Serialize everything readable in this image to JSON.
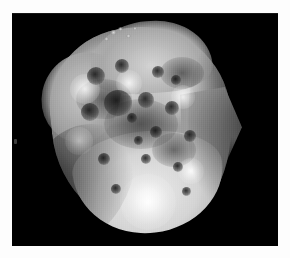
{
  "page": {
    "kind": "grayscale-spacecraft-image",
    "width_px": 290,
    "height_px": 258,
    "background_color": "#fdfdfd",
    "caption": ""
  },
  "image_frame": {
    "name": "image-frame",
    "left_px": 12,
    "top_px": 13,
    "width_px": 266,
    "height_px": 233,
    "background_color": "#000000",
    "border_color": "#000000"
  },
  "subject": {
    "name": "irregular-small-body",
    "description": "Heavily cratered irregular body filling most of the frame, brightly lit from the lower left with a rounded bright southern limb and a dark mottled cratered midsection.",
    "silhouette": {
      "left_px": 58,
      "top_px": 28,
      "right_px": 228,
      "bottom_px": 231,
      "orientation_deg": -6,
      "shape": "rounded-triangular-lump"
    },
    "surface_tone": {
      "highlight": "#ececec",
      "midtone": "#a8a8a8",
      "shadow": "#3c3c3c",
      "space_background": "#000000"
    }
  },
  "features": {
    "craters": [
      {
        "name": "crater-nw-rim",
        "cx": 96,
        "cy": 76,
        "r": 9,
        "tone": "dark"
      },
      {
        "name": "crater-n-central",
        "cx": 122,
        "cy": 66,
        "r": 7,
        "tone": "dark"
      },
      {
        "name": "crater-ne-pair-a",
        "cx": 158,
        "cy": 72,
        "r": 6,
        "tone": "dark"
      },
      {
        "name": "crater-ne-pair-b",
        "cx": 176,
        "cy": 80,
        "r": 5,
        "tone": "dark"
      },
      {
        "name": "crater-central-big",
        "cx": 118,
        "cy": 104,
        "r": 14,
        "tone": "dark"
      },
      {
        "name": "crater-central-e",
        "cx": 146,
        "cy": 100,
        "r": 8,
        "tone": "dark"
      },
      {
        "name": "crater-mid-e",
        "cx": 172,
        "cy": 108,
        "r": 7,
        "tone": "dark"
      },
      {
        "name": "crater-mid-w",
        "cx": 90,
        "cy": 112,
        "r": 9,
        "tone": "dark"
      },
      {
        "name": "crater-small-c1",
        "cx": 132,
        "cy": 118,
        "r": 5,
        "tone": "dark"
      },
      {
        "name": "crater-small-c2",
        "cx": 156,
        "cy": 132,
        "r": 6,
        "tone": "dark"
      },
      {
        "name": "crater-small-c3",
        "cx": 138,
        "cy": 140,
        "r": 4,
        "tone": "dark"
      },
      {
        "name": "crater-se-rim",
        "cx": 190,
        "cy": 136,
        "r": 6,
        "tone": "dark"
      },
      {
        "name": "crater-s-central",
        "cx": 146,
        "cy": 158,
        "r": 5,
        "tone": "dark"
      },
      {
        "name": "crater-s-east",
        "cx": 178,
        "cy": 166,
        "r": 5,
        "tone": "dark"
      },
      {
        "name": "crater-s-west",
        "cx": 104,
        "cy": 158,
        "r": 6,
        "tone": "dark"
      },
      {
        "name": "crater-sw-low",
        "cx": 116,
        "cy": 188,
        "r": 5,
        "tone": "dark"
      },
      {
        "name": "crater-se-low",
        "cx": 186,
        "cy": 190,
        "r": 4,
        "tone": "dark"
      }
    ],
    "bright_patches": [
      {
        "name": "highlight-nw-shoulder",
        "cx": 84,
        "cy": 88,
        "r": 14
      },
      {
        "name": "highlight-n-ridge",
        "cx": 128,
        "cy": 82,
        "r": 12
      },
      {
        "name": "highlight-ne-limb",
        "cx": 182,
        "cy": 96,
        "r": 11
      },
      {
        "name": "highlight-w-flank",
        "cx": 78,
        "cy": 140,
        "r": 13
      },
      {
        "name": "highlight-s-cap",
        "cx": 146,
        "cy": 200,
        "r": 26
      },
      {
        "name": "highlight-se-flank",
        "cx": 190,
        "cy": 170,
        "r": 12
      }
    ],
    "dark_patches": [
      {
        "name": "albedo-dark-nw",
        "cx": 104,
        "cy": 92,
        "rx": 26,
        "ry": 18
      },
      {
        "name": "albedo-dark-center",
        "cx": 140,
        "cy": 116,
        "rx": 34,
        "ry": 22
      },
      {
        "name": "albedo-dark-ne",
        "cx": 184,
        "cy": 70,
        "rx": 20,
        "ry": 14
      },
      {
        "name": "albedo-dark-se",
        "cx": 176,
        "cy": 148,
        "rx": 20,
        "ry": 15
      }
    ],
    "detached_specks": [
      {
        "name": "speck-a",
        "cx": 113,
        "cy": 33,
        "r": 3
      },
      {
        "name": "speck-b",
        "cx": 120,
        "cy": 30,
        "r": 2
      },
      {
        "name": "speck-c",
        "cx": 128,
        "cy": 36,
        "r": 2
      },
      {
        "name": "speck-d",
        "cx": 134,
        "cy": 29,
        "r": 2
      },
      {
        "name": "speck-e",
        "cx": 106,
        "cy": 39,
        "r": 2
      }
    ]
  },
  "margin_marks": [
    {
      "name": "margin-fleck",
      "x": 14,
      "y": 139,
      "w": 3,
      "h": 5
    }
  ]
}
